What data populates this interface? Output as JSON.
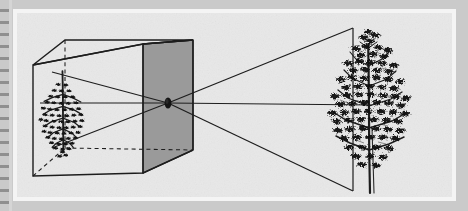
{
  "figure": {
    "medium": "halftone-scan-book-plate",
    "background_color": "#cacaca",
    "plate_color": "#e8e8e8",
    "frame_color": "#f4f4f4",
    "ink_color": "#1d1d1d",
    "shaded_face_color": "#9a9a9a",
    "caption": "",
    "label": ""
  },
  "box": {
    "name": "camera-obscura-box",
    "description": "wireframe cube drawn in oblique projection",
    "front_face": {
      "top_left": [
        33,
        65
      ],
      "top_right": [
        143,
        44
      ],
      "bottom_right": [
        143,
        173
      ],
      "bottom_left": [
        33,
        176
      ]
    },
    "back_face": {
      "top_left": [
        65,
        40
      ],
      "top_right": [
        193,
        40
      ],
      "bottom_right": [
        193,
        150
      ],
      "bottom_left": [
        65,
        148
      ]
    },
    "shaded_face": "right",
    "hidden_edges": "dashed"
  },
  "pinhole": {
    "name": "pinhole-aperture",
    "center": [
      168,
      103
    ],
    "radius_x": 3.2,
    "radius_y": 5.4,
    "color": "#141414"
  },
  "object_tree": {
    "name": "real-tree-subject",
    "orientation": "upright",
    "position": [
      370,
      110
    ],
    "top": [
      352,
      30
    ],
    "base": [
      352,
      190
    ],
    "height": 160
  },
  "image_tree": {
    "name": "inverted-projected-image",
    "orientation": "inverted",
    "position": [
      63,
      115
    ],
    "top": [
      63,
      73
    ],
    "base": [
      63,
      160
    ],
    "height": 87
  },
  "rays": [
    {
      "name": "ray-upper",
      "from": [
        352,
        30
      ],
      "through": [
        168,
        103
      ],
      "to": [
        58,
        148
      ],
      "description": "ray from treetop through pinhole to lower projection"
    },
    {
      "name": "ray-axis",
      "from": [
        352,
        110
      ],
      "through": [
        168,
        103
      ],
      "to": [
        40,
        103
      ],
      "description": "central optical axis ray"
    },
    {
      "name": "ray-lower",
      "from": [
        352,
        190
      ],
      "through": [
        168,
        103
      ],
      "to": [
        58,
        70
      ],
      "description": "ray from tree base through pinhole to upper projection"
    }
  ],
  "projection_cone": {
    "name": "light-cone-outside",
    "apex": [
      168,
      103
    ],
    "top_edge_to": [
      352,
      30
    ],
    "bottom_edge_to": [
      352,
      190
    ],
    "back_plane_x": 352
  }
}
